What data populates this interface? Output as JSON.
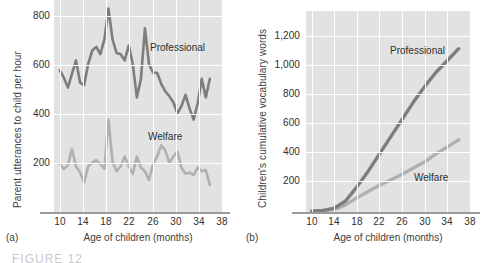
{
  "figure": {
    "caption": "FIGURE 12"
  },
  "panels": [
    {
      "letter": "(a)",
      "ylabel": "Parent utterances to child per hour",
      "xlabel": "Age of children (months)",
      "yticks": [
        "200",
        "400",
        "600",
        "800"
      ],
      "xticks": [
        "10",
        "14",
        "18",
        "22",
        "26",
        "30",
        "34",
        "38"
      ],
      "labels": {
        "professional": "Professional",
        "welfare": "Welfare"
      }
    },
    {
      "letter": "(b)",
      "ylabel": "Children's cumulative vocabulary words",
      "xlabel": "Age of children (months)",
      "yticks": [
        "200",
        "400",
        "600",
        "800",
        "1,000",
        "1,200"
      ],
      "xticks": [
        "10",
        "14",
        "18",
        "22",
        "26",
        "30",
        "34",
        "38"
      ],
      "labels": {
        "professional": "Professional",
        "welfare": "Welfare"
      }
    }
  ],
  "colors": {
    "professional": "#7d7d7d",
    "welfare": "#b0b0b0",
    "plot_background": "#e2e2e2",
    "gridline": "#ffffff",
    "axis": "#9a9a9a"
  },
  "chart_data": [
    {
      "type": "line",
      "title": "",
      "panel": "a",
      "xlabel": "Age of children (months)",
      "ylabel": "Parent utterances to child per hour",
      "xlim": [
        9,
        38
      ],
      "ylim": [
        0,
        860
      ],
      "yticks": [
        200,
        400,
        600,
        800
      ],
      "xticks": [
        10,
        14,
        18,
        22,
        26,
        30,
        34,
        38
      ],
      "grid": true,
      "legend": "inline-annotation",
      "x": [
        10,
        10.7,
        11.4,
        12.1,
        12.8,
        13.5,
        14.2,
        14.9,
        15.6,
        16.3,
        17,
        17.7,
        18.4,
        19.1,
        19.8,
        20.5,
        21.2,
        21.9,
        22.6,
        23.3,
        24,
        24.7,
        25.4,
        26.1,
        26.8,
        27.5,
        28.2,
        28.9,
        29.6,
        30.3,
        31,
        31.7,
        32.4,
        33.1,
        33.8,
        34.5,
        35.2,
        35.9
      ],
      "series": [
        {
          "name": "Professional",
          "color": "#7d7d7d",
          "values": [
            575,
            545,
            505,
            560,
            615,
            525,
            515,
            600,
            655,
            670,
            640,
            700,
            825,
            700,
            645,
            640,
            615,
            675,
            600,
            465,
            540,
            745,
            600,
            565,
            565,
            520,
            490,
            470,
            445,
            400,
            430,
            475,
            420,
            375,
            440,
            540,
            465,
            540
          ]
        },
        {
          "name": "Welfare",
          "color": "#b0b0b0",
          "values": [
            195,
            175,
            190,
            255,
            185,
            160,
            120,
            185,
            200,
            210,
            195,
            175,
            375,
            205,
            165,
            185,
            225,
            185,
            155,
            225,
            180,
            165,
            130,
            195,
            225,
            270,
            250,
            200,
            225,
            245,
            180,
            155,
            160,
            150,
            180,
            165,
            170,
            110
          ]
        }
      ]
    },
    {
      "type": "line",
      "title": "",
      "panel": "b",
      "xlabel": "Age of children (months)",
      "ylabel": "Children's cumulative vocabulary words",
      "xlim": [
        9,
        38
      ],
      "ylim": [
        0,
        1280
      ],
      "yticks": [
        200,
        400,
        600,
        800,
        1000,
        1200
      ],
      "xticks": [
        10,
        14,
        18,
        22,
        26,
        30,
        34,
        38
      ],
      "grid": true,
      "legend": "inline-annotation",
      "x": [
        10,
        12,
        14,
        16,
        18,
        20,
        22,
        24,
        26,
        28,
        30,
        32,
        34,
        36
      ],
      "series": [
        {
          "name": "Professional",
          "color": "#7d7d7d",
          "values": [
            5,
            10,
            25,
            70,
            160,
            260,
            370,
            480,
            590,
            700,
            800,
            890,
            965,
            1040
          ]
        },
        {
          "name": "Welfare",
          "color": "#b0b0b0",
          "values": [
            5,
            8,
            15,
            45,
            90,
            130,
            170,
            205,
            240,
            280,
            320,
            370,
            415,
            460
          ]
        }
      ]
    }
  ]
}
